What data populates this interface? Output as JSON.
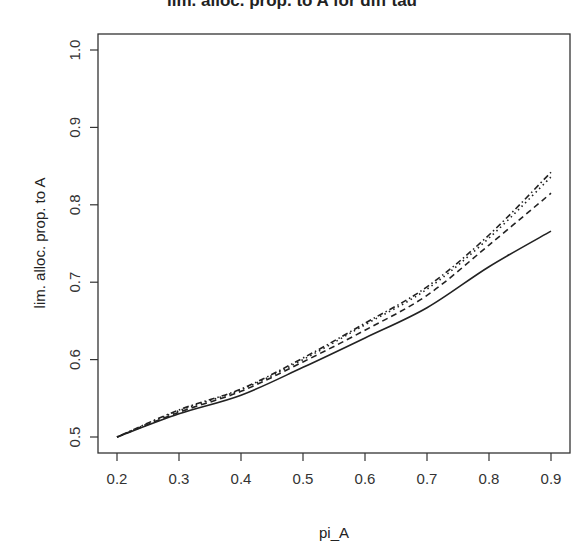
{
  "chart_data": {
    "type": "line",
    "title": "lim. alloc. prop. to A for diff tau",
    "xlabel": "pi_A",
    "ylabel": "lim. alloc. prop. to A",
    "xlim": [
      0.2,
      0.9
    ],
    "ylim": [
      0.5,
      1.0
    ],
    "x_ticks": [
      "0.2",
      "0.3",
      "0.4",
      "0.5",
      "0.6",
      "0.7",
      "0.8",
      "0.9"
    ],
    "y_ticks": [
      "0.5",
      "0.6",
      "0.7",
      "0.8",
      "0.9",
      "1.0"
    ],
    "grid": false,
    "legend": "none",
    "x": [
      0.2,
      0.3,
      0.4,
      0.5,
      0.6,
      0.7,
      0.8,
      0.9
    ],
    "series": [
      {
        "name": "solid",
        "line_style": "solid",
        "values": [
          0.5,
          0.53,
          0.554,
          0.59,
          0.628,
          0.667,
          0.72,
          0.766
        ]
      },
      {
        "name": "dashed",
        "line_style": "dashed",
        "values": [
          0.5,
          0.532,
          0.559,
          0.597,
          0.638,
          0.683,
          0.748,
          0.815
        ]
      },
      {
        "name": "dotted",
        "line_style": "dotted",
        "values": [
          0.5,
          0.534,
          0.561,
          0.6,
          0.645,
          0.691,
          0.757,
          0.836
        ]
      },
      {
        "name": "dotdash",
        "line_style": "dotdash",
        "values": [
          0.5,
          0.535,
          0.562,
          0.602,
          0.647,
          0.694,
          0.761,
          0.842
        ]
      }
    ]
  }
}
